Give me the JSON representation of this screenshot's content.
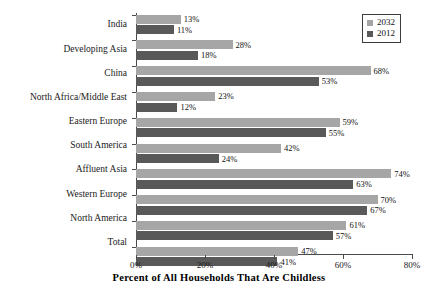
{
  "chart_data": {
    "type": "bar",
    "orientation": "horizontal",
    "title": "",
    "xlabel": "Percent of All Households That Are Childless",
    "ylabel": "",
    "xlim": [
      0,
      80
    ],
    "xtick_labels": [
      "0%",
      "20%",
      "40%",
      "60%",
      "80%"
    ],
    "xtick_values": [
      0,
      20,
      40,
      60,
      80
    ],
    "grid": false,
    "legend_position": "top-right",
    "categories": [
      "India",
      "Developing Asia",
      "China",
      "North Africa/Middle East",
      "Eastern Europe",
      "South America",
      "Affluent Asia",
      "Western Europe",
      "North America",
      "Total"
    ],
    "series": [
      {
        "name": "2032",
        "color": "#a6a6a6",
        "values": [
          13,
          28,
          68,
          23,
          59,
          42,
          74,
          70,
          61,
          47
        ],
        "labels": [
          "13%",
          "28%",
          "68%",
          "23%",
          "59%",
          "42%",
          "74%",
          "70%",
          "61%",
          "47%"
        ]
      },
      {
        "name": "2012",
        "color": "#595959",
        "values": [
          11,
          18,
          53,
          12,
          55,
          24,
          63,
          67,
          57,
          41
        ],
        "labels": [
          "11%",
          "18%",
          "53%",
          "12%",
          "55%",
          "24%",
          "63%",
          "67%",
          "57%",
          "41%"
        ]
      }
    ]
  },
  "legend": {
    "items": [
      {
        "label": "2032",
        "color": "#a6a6a6"
      },
      {
        "label": "2012",
        "color": "#595959"
      }
    ]
  }
}
